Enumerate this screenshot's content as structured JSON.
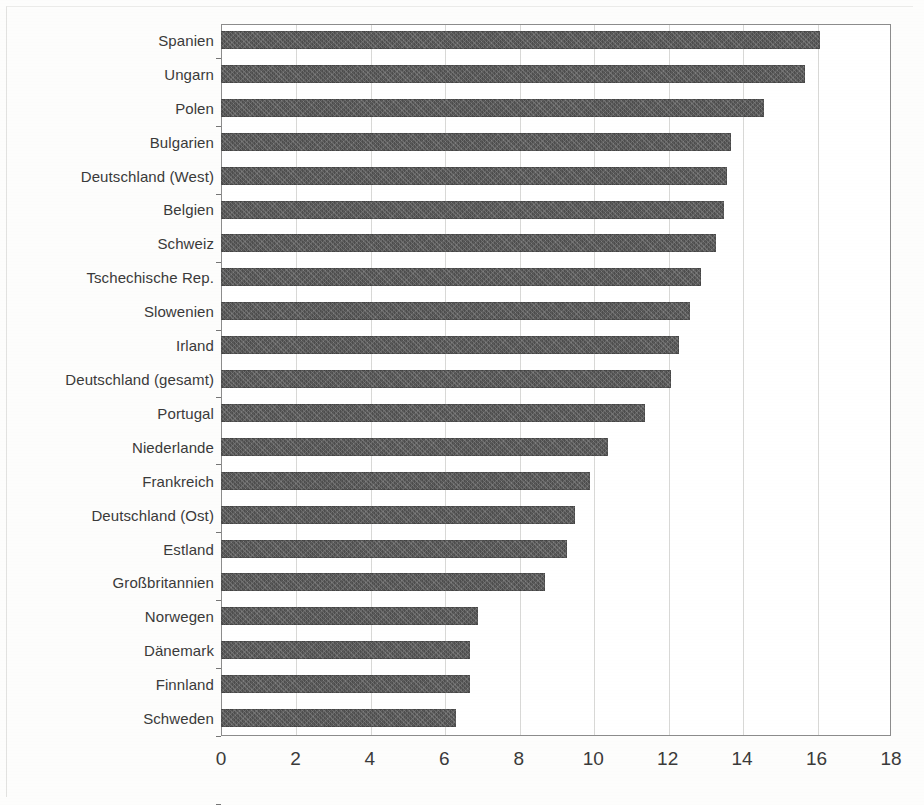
{
  "chart_data": {
    "type": "bar",
    "orientation": "horizontal",
    "title": "",
    "subtitle": "",
    "xlabel": "",
    "ylabel": "",
    "xlim": [
      0,
      18
    ],
    "xticks": [
      0,
      2,
      4,
      6,
      8,
      10,
      12,
      14,
      16,
      18
    ],
    "xtick_labels": [
      "0",
      "2",
      "4",
      "6",
      "8",
      "10",
      "12",
      "14",
      "16",
      "18"
    ],
    "grid": "vertical",
    "legend": "none",
    "bar_color": "#4d4d4d",
    "categories": [
      "Spanien",
      "Ungarn",
      "Polen",
      "Bulgarien",
      "Deutschland (West)",
      "Belgien",
      "Schweiz",
      "Tschechische Rep.",
      "Slowenien",
      "Irland",
      "Deutschland (gesamt)",
      "Portugal",
      "Niederlande",
      "Frankreich",
      "Deutschland (Ost)",
      "Estland",
      "Großbritannien",
      "Norwegen",
      "Dänemark",
      "Finnland",
      "Schweden"
    ],
    "values": [
      16.1,
      15.7,
      14.6,
      13.7,
      13.6,
      13.5,
      13.3,
      12.9,
      12.6,
      12.3,
      12.1,
      11.4,
      10.4,
      9.9,
      9.5,
      9.3,
      8.7,
      6.9,
      6.7,
      6.7,
      6.3
    ]
  }
}
